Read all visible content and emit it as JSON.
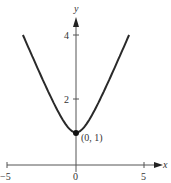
{
  "chart_data": {
    "type": "line",
    "title": "",
    "xlabel": "x",
    "ylabel": "y",
    "xlim": [
      -5,
      5.8
    ],
    "ylim": [
      0,
      4.6
    ],
    "x_ticks": [
      -5,
      0,
      5
    ],
    "x_tick_labels": [
      "−5",
      "0",
      "5"
    ],
    "y_ticks": [
      2,
      4
    ],
    "y_tick_labels": [
      "2",
      "4"
    ],
    "grid": false,
    "legend": null,
    "series": [
      {
        "name": "y = sqrt(1 + x^2)",
        "x": [
          -3.873,
          -3,
          -2,
          -1,
          -0.5,
          0,
          0.5,
          1,
          2,
          3,
          3.873
        ],
        "y": [
          4.0,
          3.162,
          2.236,
          1.414,
          1.118,
          1.0,
          1.118,
          1.414,
          2.236,
          3.162,
          4.0
        ]
      }
    ],
    "annotations": [
      {
        "text": "(0, 1)",
        "x": 0,
        "y": 1,
        "marker": "filled-circle"
      }
    ]
  },
  "labels": {
    "x_axis": "x",
    "y_axis": "y",
    "x_neg5": "−5",
    "x_0": "0",
    "x_5": "5",
    "y_2": "2",
    "y_4": "4",
    "point": "(0, 1)"
  }
}
